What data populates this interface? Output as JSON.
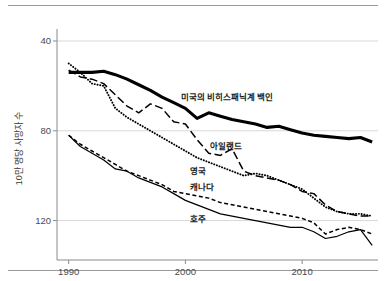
{
  "figure": {
    "y_axis_title": "10만 명당 사망자 수",
    "y_ticks": [
      "120",
      "80",
      "40"
    ],
    "x_ticks": [
      "1990",
      "2000",
      "2010"
    ],
    "labels": {
      "us": "미국의 비히스패닉계 백인",
      "ireland": "아일랜드",
      "uk": "영국",
      "canada": "캐나다",
      "australia": "호주"
    }
  },
  "chart_data": {
    "type": "line",
    "title": "",
    "subtitle": "",
    "xlabel": "",
    "ylabel": "10만 명당 사망자 수",
    "xlim": [
      1989,
      2016.5
    ],
    "ylim": [
      26,
      124
    ],
    "x_ticks": [
      1990,
      2000,
      2010
    ],
    "y_ticks": [
      40,
      80,
      120
    ],
    "grid": "horizontal",
    "legend": "inline-annotations",
    "x": [
      1990,
      1991,
      1992,
      1993,
      1994,
      1995,
      1996,
      1997,
      1998,
      1999,
      2000,
      2001,
      2002,
      2003,
      2004,
      2005,
      2006,
      2007,
      2008,
      2009,
      2010,
      2011,
      2012,
      2013,
      2014,
      2015,
      2016
    ],
    "series": [
      {
        "name": "미국의 비히스패닉계 백인",
        "key": "us",
        "style": "solid-thick",
        "color": "#000000",
        "label_position": {
          "x": 1999.6,
          "y": 95.5
        },
        "values": [
          106,
          106,
          106,
          106.5,
          105,
          103,
          100.5,
          98,
          95,
          92.5,
          90,
          85.5,
          88,
          86.5,
          85,
          84,
          83,
          81.5,
          82,
          80.5,
          79,
          78,
          77.5,
          77,
          76.5,
          77,
          75
        ]
      },
      {
        "name": "아일랜드",
        "key": "ireland",
        "style": "dash-long",
        "color": "#000000",
        "label_position": {
          "x": 2002.1,
          "y": 73.5
        },
        "values": [
          107,
          104,
          103,
          101,
          96,
          91,
          88,
          92,
          90,
          84,
          83,
          76,
          70,
          69,
          72,
          62,
          60,
          59,
          58,
          56,
          53,
          52,
          47,
          44,
          43,
          42,
          42
        ]
      },
      {
        "name": "영국",
        "key": "uk",
        "style": "dotted",
        "color": "#000000",
        "label_position": {
          "x": 2000.4,
          "y": 62.5
        },
        "values": [
          110,
          106,
          101,
          100,
          90,
          86,
          83,
          80,
          77,
          74,
          71,
          68,
          66,
          64,
          62,
          60,
          61,
          60,
          58,
          56,
          54,
          50,
          46,
          44,
          43,
          43,
          42
        ]
      },
      {
        "name": "캐나다",
        "key": "canada",
        "style": "dash-short",
        "color": "#000000",
        "label_position": {
          "x": 2000.4,
          "y": 55.5
        },
        "values": [
          78,
          74,
          71,
          68,
          65,
          62,
          60,
          58,
          56,
          53,
          52,
          51,
          50,
          48,
          47,
          46,
          45,
          44,
          43,
          42,
          41,
          39,
          34,
          36,
          37,
          36,
          34
        ]
      },
      {
        "name": "호주",
        "key": "australia",
        "style": "solid-thin",
        "color": "#000000",
        "label_position": {
          "x": 2000.4,
          "y": 41.0
        },
        "values": [
          78,
          73,
          70,
          67,
          63,
          62,
          59,
          57,
          55,
          52,
          49,
          47,
          45,
          43,
          42,
          41,
          40,
          39,
          38,
          37,
          37,
          35,
          32,
          33,
          35,
          36,
          29
        ]
      }
    ]
  }
}
